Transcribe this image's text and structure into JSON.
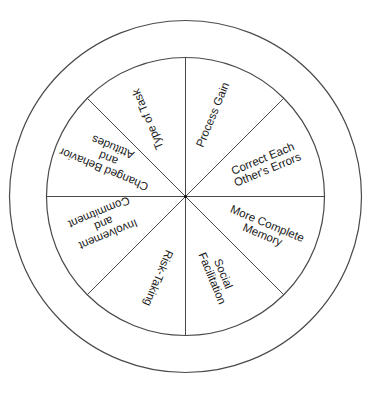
{
  "diagram": {
    "type": "wheel",
    "center": [
      185,
      197
    ],
    "inner_radius": 139,
    "outer_radius": 176,
    "line_color": "#4a4a4a",
    "sectors": [
      {
        "label": "Process Gain",
        "bearing": 22.5
      },
      {
        "label": "Correct Each\nOther's Errors",
        "bearing": 67.5
      },
      {
        "label": "More Complete\nMemory",
        "bearing": 112.5
      },
      {
        "label": "Social\nFacilitation",
        "bearing": 157.5
      },
      {
        "label": "Risk-Taking",
        "bearing": 202.5
      },
      {
        "label": "Involvement\nand\nCommitment",
        "bearing": 247.5
      },
      {
        "label": "Changed Behavior\nand\nAttitudes",
        "bearing": 292.5
      },
      {
        "label": "Type of Task",
        "bearing": 337.5
      }
    ]
  }
}
